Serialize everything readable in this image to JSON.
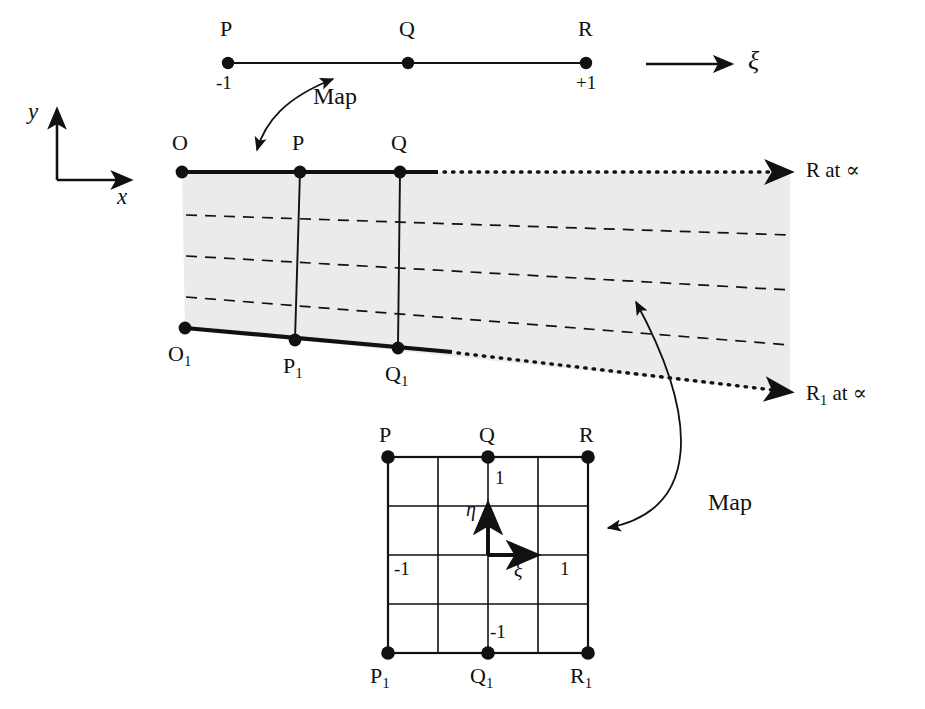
{
  "figure": {
    "type": "mathematical-mapping-diagram",
    "colors": {
      "ink": "#111111",
      "shade": "#ebebeb",
      "background": "#ffffff"
    }
  },
  "parent_line": {
    "name": "one-dimensional-parent-line",
    "points": [
      {
        "label": "P",
        "coord_label": "-1"
      },
      {
        "label": "Q",
        "coord_label": ""
      },
      {
        "label": "R",
        "coord_label": "+1"
      }
    ],
    "axis_label": "ξ"
  },
  "global_axes": {
    "y_label": "y",
    "x_label": "x"
  },
  "map_labels": {
    "top": "Map",
    "bottom": "Map"
  },
  "physical_domain": {
    "name": "infinite-element-physical-domain",
    "top_nodes": [
      {
        "label": "O"
      },
      {
        "label": "P"
      },
      {
        "label": "Q"
      }
    ],
    "bottom_nodes": [
      {
        "label": "O",
        "sub": "1"
      },
      {
        "label": "P",
        "sub": "1"
      },
      {
        "label": "Q",
        "sub": "1"
      }
    ],
    "far_field_top": {
      "label": "R at ∝",
      "text_main": "R",
      "text_rest": " at ∝"
    },
    "far_field_bottom": {
      "label": "R",
      "sub": "1",
      "text_rest": " at ∝"
    },
    "dashed_line_count": 3
  },
  "parent_square": {
    "name": "two-dimensional-parent-element",
    "grid_divisions": 4,
    "corner_top": [
      {
        "label": "P"
      },
      {
        "label": "Q"
      },
      {
        "label": "R"
      }
    ],
    "corner_bottom": [
      {
        "label": "P",
        "sub": "1"
      },
      {
        "label": "Q",
        "sub": "1"
      },
      {
        "label": "R",
        "sub": "1"
      }
    ],
    "axis_eta": "η",
    "axis_xi": "ξ",
    "tick_top": "1",
    "tick_bottom": "-1",
    "tick_left": "-1",
    "tick_right": "1"
  }
}
